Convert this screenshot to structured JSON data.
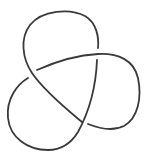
{
  "diagram": {
    "title": "Trefoil knot",
    "type": "knot-diagram",
    "crossings": 3,
    "background_color": "#ffffff",
    "stroke_color": "#3a3a3a",
    "stroke_width": 1.8,
    "gap": "under-strand broken at each crossing"
  }
}
